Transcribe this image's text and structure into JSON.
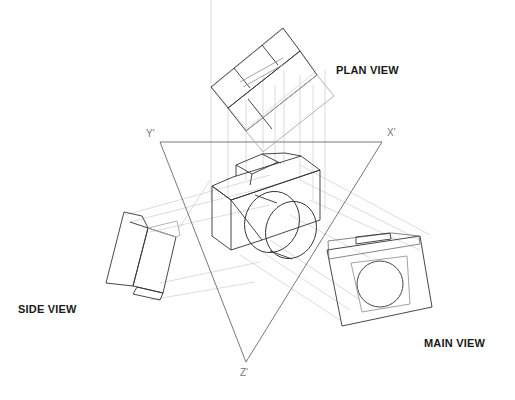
{
  "diagram": {
    "type": "axonometric projection of a camera",
    "labels": {
      "plan_view": "PLAN VIEW",
      "side_view": "SIDE VIEW",
      "main_view": "MAIN VIEW"
    },
    "axes": {
      "x": "X'",
      "y": "Y'",
      "z": "Z'"
    },
    "colors": {
      "line_dark": "#333333",
      "line_light": "#bbbbbb",
      "text": "#1a1a1a",
      "axis_text": "#777777"
    }
  }
}
